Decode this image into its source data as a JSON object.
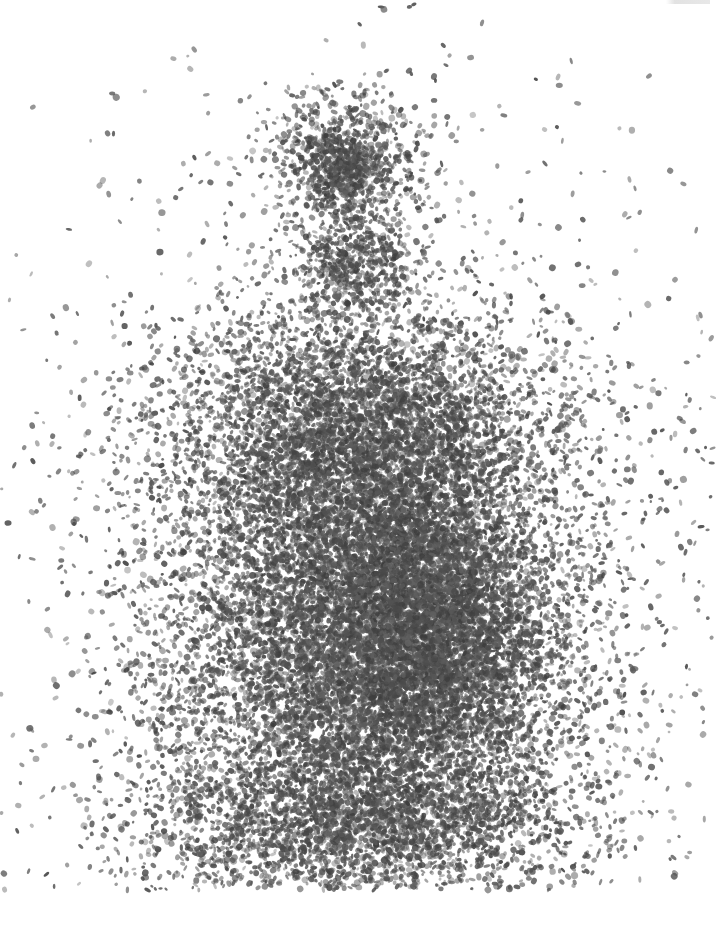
{
  "image": {
    "width": 716,
    "height": 928,
    "background": "#ffffff",
    "dot_color": "#4a4a4a",
    "description": "grayscale stippled dot-density image: small head-like cluster above a large dense torso-like mass"
  },
  "regions": [
    {
      "name": "head-cluster",
      "cx": 345,
      "cy": 165,
      "rx": 70,
      "ry": 75,
      "count": 900,
      "core_count": 350,
      "core_rx": 28,
      "core_ry": 35
    },
    {
      "name": "neck",
      "cx": 355,
      "cy": 270,
      "rx": 55,
      "ry": 45,
      "count": 500
    },
    {
      "name": "upper-torso",
      "cx": 360,
      "cy": 440,
      "rx": 170,
      "ry": 120,
      "count": 5200
    },
    {
      "name": "lower-torso",
      "cx": 370,
      "cy": 650,
      "rx": 185,
      "ry": 190,
      "count": 9000
    },
    {
      "name": "dense-core",
      "cx": 430,
      "cy": 620,
      "rx": 100,
      "ry": 130,
      "count": 3500
    },
    {
      "name": "lower-legs",
      "cx": 360,
      "cy": 820,
      "rx": 200,
      "ry": 70,
      "count": 2600
    },
    {
      "name": "halo",
      "cx": 370,
      "cy": 560,
      "rx": 330,
      "ry": 400,
      "count": 2200
    }
  ],
  "cutoff_bottom_y": 890,
  "seed": 20240611
}
